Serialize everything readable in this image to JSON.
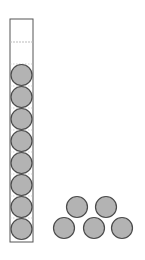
{
  "figure": {
    "colors": {
      "background": "#ffffff",
      "tube_stroke": "#555555",
      "dash_line": "#bbbbbb",
      "counter_fill": "#b3b3b3",
      "counter_stroke": "#4a4a4a"
    },
    "tube": {
      "x": 10,
      "y": 19,
      "width": 23,
      "height": 223,
      "fill_line_y": 42,
      "counter_count": 8
    },
    "tube_counters": [
      {
        "cx": 21.5,
        "cy": 75
      },
      {
        "cx": 21.5,
        "cy": 97
      },
      {
        "cx": 21.5,
        "cy": 119
      },
      {
        "cx": 21.5,
        "cy": 141
      },
      {
        "cx": 21.5,
        "cy": 163
      },
      {
        "cx": 21.5,
        "cy": 185
      },
      {
        "cx": 21.5,
        "cy": 207
      },
      {
        "cx": 21.5,
        "cy": 229
      }
    ],
    "loose_counters": [
      {
        "cx": 77,
        "cy": 207
      },
      {
        "cx": 106,
        "cy": 207
      },
      {
        "cx": 64,
        "cy": 228
      },
      {
        "cx": 94,
        "cy": 228
      },
      {
        "cx": 122,
        "cy": 228
      }
    ],
    "counter_radius": 10.5,
    "loose_counter_count": 5
  }
}
